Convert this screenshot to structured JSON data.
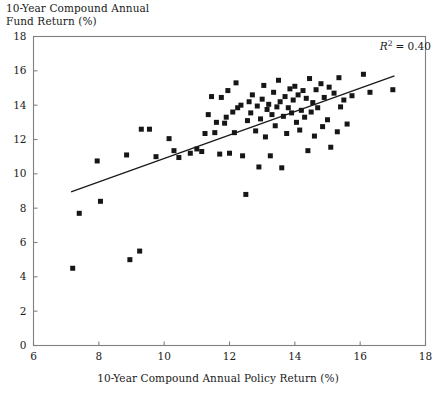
{
  "figure": {
    "y_axis_title": "10-Year Compound Annual\nFund Return (%)",
    "x_axis_title": "10-Year Compound Annual Policy Return (%)",
    "annotation_r": "R",
    "annotation_sup": "2",
    "annotation_value": "= 0.40",
    "marker_color": "#161616",
    "line_color": "#1a1a1a",
    "frame_color": "#808080"
  },
  "chart_data": {
    "type": "scatter",
    "title": "",
    "xlabel": "10-Year Compound Annual Policy Return (%)",
    "ylabel": "10-Year Compound Annual Fund Return (%)",
    "xlim": [
      6,
      18
    ],
    "ylim": [
      0,
      18
    ],
    "xticks": [
      6,
      8,
      10,
      12,
      14,
      16,
      18
    ],
    "yticks": [
      0,
      2,
      4,
      6,
      8,
      10,
      12,
      14,
      16,
      18
    ],
    "grid": false,
    "legend": "none",
    "annotations": [
      {
        "text": "R2 = 0.40",
        "x": 16.6,
        "y": 17.2,
        "r_squared": 0.4
      }
    ],
    "trendline": {
      "type": "linear",
      "x_start": 7.15,
      "y_start": 8.95,
      "x_end": 17.05,
      "y_end": 15.7,
      "slope": 0.682,
      "intercept": 4.07
    },
    "series": [
      {
        "name": "Funds",
        "marker": "square",
        "color": "#161616",
        "points": [
          [
            7.2,
            4.5
          ],
          [
            7.4,
            7.7
          ],
          [
            8.05,
            8.4
          ],
          [
            7.95,
            10.75
          ],
          [
            8.95,
            5.0
          ],
          [
            9.25,
            5.5
          ],
          [
            8.85,
            11.1
          ],
          [
            9.3,
            12.6
          ],
          [
            9.55,
            12.6
          ],
          [
            9.75,
            11.0
          ],
          [
            10.15,
            12.05
          ],
          [
            10.3,
            11.35
          ],
          [
            10.45,
            10.95
          ],
          [
            10.8,
            11.2
          ],
          [
            11.0,
            11.45
          ],
          [
            11.15,
            11.3
          ],
          [
            11.25,
            12.35
          ],
          [
            11.35,
            13.45
          ],
          [
            11.45,
            14.5
          ],
          [
            11.55,
            12.4
          ],
          [
            11.6,
            13.0
          ],
          [
            11.7,
            11.15
          ],
          [
            11.75,
            14.45
          ],
          [
            11.85,
            12.95
          ],
          [
            11.9,
            13.3
          ],
          [
            11.95,
            14.85
          ],
          [
            12.0,
            11.2
          ],
          [
            12.1,
            13.6
          ],
          [
            12.15,
            12.4
          ],
          [
            12.2,
            15.3
          ],
          [
            12.25,
            13.85
          ],
          [
            12.35,
            14.0
          ],
          [
            12.4,
            11.05
          ],
          [
            12.5,
            8.8
          ],
          [
            12.55,
            13.1
          ],
          [
            12.6,
            14.2
          ],
          [
            12.65,
            13.55
          ],
          [
            12.7,
            14.6
          ],
          [
            12.8,
            12.5
          ],
          [
            12.85,
            13.95
          ],
          [
            12.9,
            10.4
          ],
          [
            12.95,
            13.2
          ],
          [
            13.0,
            14.35
          ],
          [
            13.05,
            15.15
          ],
          [
            13.1,
            12.15
          ],
          [
            13.15,
            13.75
          ],
          [
            13.2,
            14.05
          ],
          [
            13.25,
            11.05
          ],
          [
            13.3,
            13.45
          ],
          [
            13.35,
            14.75
          ],
          [
            13.4,
            12.8
          ],
          [
            13.45,
            13.9
          ],
          [
            13.5,
            15.45
          ],
          [
            13.55,
            14.2
          ],
          [
            13.6,
            10.35
          ],
          [
            13.65,
            13.35
          ],
          [
            13.7,
            14.5
          ],
          [
            13.75,
            12.35
          ],
          [
            13.8,
            13.85
          ],
          [
            13.85,
            14.95
          ],
          [
            13.9,
            13.55
          ],
          [
            13.95,
            14.3
          ],
          [
            14.0,
            15.1
          ],
          [
            14.05,
            13.0
          ],
          [
            14.1,
            14.6
          ],
          [
            14.15,
            12.55
          ],
          [
            14.2,
            13.7
          ],
          [
            14.25,
            14.85
          ],
          [
            14.3,
            13.3
          ],
          [
            14.35,
            14.4
          ],
          [
            14.4,
            11.35
          ],
          [
            14.45,
            15.55
          ],
          [
            14.5,
            13.6
          ],
          [
            14.55,
            14.15
          ],
          [
            14.6,
            12.2
          ],
          [
            14.65,
            14.9
          ],
          [
            14.7,
            13.85
          ],
          [
            14.8,
            15.25
          ],
          [
            14.85,
            12.75
          ],
          [
            14.9,
            14.45
          ],
          [
            15.0,
            13.15
          ],
          [
            15.05,
            15.05
          ],
          [
            15.1,
            11.55
          ],
          [
            15.2,
            14.7
          ],
          [
            15.3,
            12.45
          ],
          [
            15.35,
            15.6
          ],
          [
            15.4,
            13.9
          ],
          [
            15.5,
            14.3
          ],
          [
            15.6,
            12.9
          ],
          [
            15.75,
            14.55
          ],
          [
            16.1,
            15.8
          ],
          [
            16.3,
            14.75
          ],
          [
            17.0,
            14.9
          ]
        ]
      }
    ]
  }
}
